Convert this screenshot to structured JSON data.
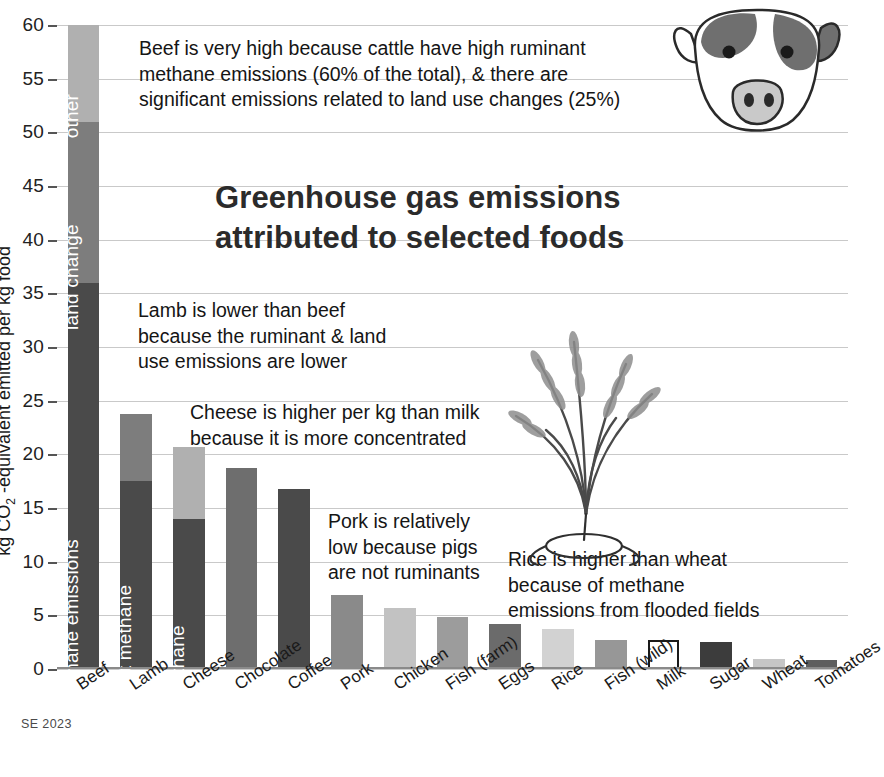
{
  "chart_data": {
    "type": "bar",
    "title": "Greenhouse gas emissions\nattributed to selected foods",
    "xlabel": "",
    "ylabel": "kg CO2 -equivalent emitted per kg food",
    "ylabel_prefix": "kg CO",
    "ylabel_sub": "2",
    "ylabel_suffix": " -equivalent emitted per kg food",
    "ylim": [
      0,
      60
    ],
    "ytick_step": 5,
    "yticks": [
      0,
      5,
      10,
      15,
      20,
      25,
      30,
      35,
      40,
      45,
      50,
      55,
      60
    ],
    "grid": true,
    "legend_position": "none",
    "credit": "SE 2023",
    "categories": [
      "Beef",
      "Lamb",
      "Cheese",
      "Chocolate",
      "Coffee",
      "Pork",
      "Chicken",
      "Fish (farm)",
      "Eggs",
      "Rice",
      "Fish (wild)",
      "Milk",
      "Sugar",
      "Wheat",
      "Tomatoes"
    ],
    "values": [
      60.0,
      23.8,
      20.7,
      18.7,
      16.8,
      6.9,
      5.7,
      4.8,
      4.2,
      3.7,
      2.7,
      2.7,
      2.5,
      0.9,
      0.8
    ],
    "bars": [
      {
        "category": "Beef",
        "total": 60.0,
        "segments": [
          {
            "label": "ruminant methane emissions",
            "value": 36.0,
            "color": "#4a4a4a",
            "label_color": "#ffffff"
          },
          {
            "label": "land change",
            "value": 15.0,
            "color": "#7d7d7d",
            "label_color": "#ffffff"
          },
          {
            "label": "other",
            "value": 9.0,
            "color": "#b0b0b0",
            "label_color": "#ffffff"
          }
        ]
      },
      {
        "category": "Lamb",
        "total": 23.8,
        "segments": [
          {
            "label": "ruminant methane",
            "value": 17.5,
            "color": "#4a4a4a",
            "label_color": "#ffffff"
          },
          {
            "label": "",
            "value": 6.3,
            "color": "#7d7d7d",
            "label_color": "#ffffff"
          }
        ]
      },
      {
        "category": "Cheese",
        "total": 20.7,
        "segments": [
          {
            "label": "methane",
            "value": 14.0,
            "color": "#4a4a4a",
            "label_color": "#ffffff"
          },
          {
            "label": "",
            "value": 6.7,
            "color": "#b0b0b0",
            "label_color": "#ffffff"
          }
        ]
      },
      {
        "category": "Chocolate",
        "total": 18.7,
        "segments": [
          {
            "label": "",
            "value": 18.7,
            "color": "#6e6e6e",
            "label_color": "#ffffff"
          }
        ]
      },
      {
        "category": "Coffee",
        "total": 16.8,
        "segments": [
          {
            "label": "",
            "value": 16.8,
            "color": "#4a4a4a",
            "label_color": "#ffffff"
          }
        ]
      },
      {
        "category": "Pork",
        "total": 6.9,
        "segments": [
          {
            "label": "",
            "value": 6.9,
            "color": "#8a8a8a",
            "label_color": "#ffffff"
          }
        ]
      },
      {
        "category": "Chicken",
        "total": 5.7,
        "segments": [
          {
            "label": "",
            "value": 5.7,
            "color": "#c2c2c2",
            "label_color": "#1a1a1a"
          }
        ]
      },
      {
        "category": "Fish (farm)",
        "total": 4.8,
        "segments": [
          {
            "label": "",
            "value": 4.8,
            "color": "#9c9c9c",
            "label_color": "#ffffff"
          }
        ]
      },
      {
        "category": "Eggs",
        "total": 4.2,
        "segments": [
          {
            "label": "",
            "value": 4.2,
            "color": "#6b6b6b",
            "label_color": "#ffffff"
          }
        ]
      },
      {
        "category": "Rice",
        "total": 3.7,
        "segments": [
          {
            "label": "",
            "value": 3.7,
            "color": "#d2d2d2",
            "label_color": "#1a1a1a"
          }
        ]
      },
      {
        "category": "Fish (wild)",
        "total": 2.7,
        "segments": [
          {
            "label": "",
            "value": 2.7,
            "color": "#979797",
            "label_color": "#ffffff"
          }
        ]
      },
      {
        "category": "Milk",
        "total": 2.7,
        "segments": [
          {
            "label": "",
            "value": 2.7,
            "color": "#ffffff",
            "label_color": "#1a1a1a",
            "outline": "#1a1a1a"
          }
        ]
      },
      {
        "category": "Sugar",
        "total": 2.5,
        "segments": [
          {
            "label": "",
            "value": 2.5,
            "color": "#3c3c3c",
            "label_color": "#ffffff"
          }
        ]
      },
      {
        "category": "Wheat",
        "total": 0.9,
        "segments": [
          {
            "label": "",
            "value": 0.9,
            "color": "#c6c6c6",
            "label_color": "#1a1a1a"
          }
        ]
      },
      {
        "category": "Tomatoes",
        "total": 0.8,
        "segments": [
          {
            "label": "",
            "value": 0.8,
            "color": "#5e5e5e",
            "label_color": "#ffffff"
          }
        ]
      }
    ],
    "annotations": [
      {
        "id": "beef",
        "text": "Beef is very high because cattle have high ruminant\nmethane emissions (60% of the total), & there are\nsignificant emissions related to land use changes (25%)"
      },
      {
        "id": "lamb",
        "text": "Lamb is lower than beef\nbecause the ruminant & land\nuse emissions are lower"
      },
      {
        "id": "cheese",
        "text": "Cheese is higher per kg than milk\nbecause it is more concentrated"
      },
      {
        "id": "pork",
        "text": "Pork is relatively\nlow because pigs\nare not ruminants"
      },
      {
        "id": "rice",
        "text": "Rice is higher than wheat\nbecause of methane\nemissions from flooded fields"
      }
    ]
  },
  "colors": {
    "segment_dark": "#4a4a4a",
    "segment_mid": "#7d7d7d",
    "segment_light": "#b0b0b0",
    "gridline": "#c9c9c9",
    "background": "#ffffff",
    "text": "#1a1a1a"
  },
  "artwork": [
    {
      "name": "cow-illustration"
    },
    {
      "name": "rice-plant-illustration"
    }
  ]
}
